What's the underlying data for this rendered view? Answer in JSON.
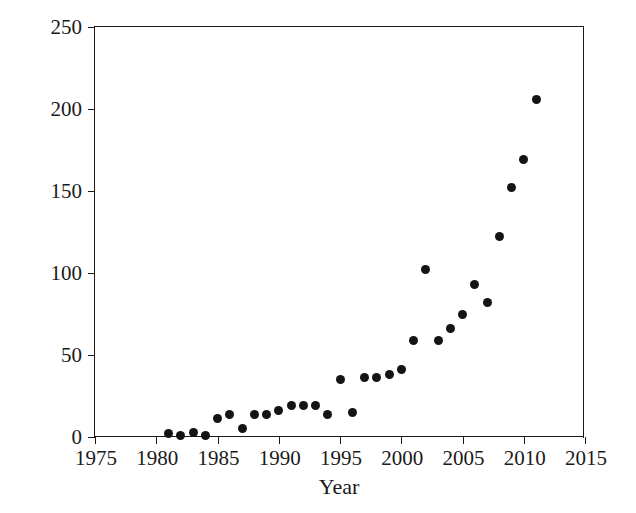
{
  "chart_data": {
    "type": "scatter",
    "title": "",
    "xlabel": "Year",
    "ylabel": "Number of Publications",
    "xlim": [
      1975,
      2015
    ],
    "ylim": [
      0,
      250
    ],
    "xticks": [
      1975,
      1980,
      1985,
      1990,
      1995,
      2000,
      2005,
      2010,
      2015
    ],
    "yticks": [
      0,
      50,
      100,
      150,
      200,
      250
    ],
    "grid": false,
    "legend": null,
    "marker": {
      "shape": "circle",
      "color": "#141414",
      "size": 9
    },
    "x": [
      1981,
      1982,
      1983,
      1984,
      1985,
      1986,
      1987,
      1988,
      1989,
      1990,
      1991,
      1992,
      1993,
      1994,
      1995,
      1996,
      1997,
      1998,
      1999,
      2000,
      2001,
      2002,
      2003,
      2004,
      2005,
      2006,
      2007,
      2008,
      2009,
      2010,
      2011
    ],
    "values": [
      2,
      1,
      3,
      1,
      11,
      14,
      5,
      14,
      14,
      16,
      19,
      19,
      19,
      14,
      35,
      15,
      36,
      36,
      38,
      41,
      59,
      102,
      59,
      66,
      75,
      93,
      82,
      122,
      152,
      169,
      206
    ],
    "points": [
      {
        "year": 1981,
        "value": 2
      },
      {
        "year": 1982,
        "value": 1
      },
      {
        "year": 1983,
        "value": 3
      },
      {
        "year": 1984,
        "value": 1
      },
      {
        "year": 1985,
        "value": 11
      },
      {
        "year": 1986,
        "value": 14
      },
      {
        "year": 1987,
        "value": 5
      },
      {
        "year": 1988,
        "value": 14
      },
      {
        "year": 1989,
        "value": 14
      },
      {
        "year": 1990,
        "value": 16
      },
      {
        "year": 1991,
        "value": 19
      },
      {
        "year": 1992,
        "value": 19
      },
      {
        "year": 1993,
        "value": 19
      },
      {
        "year": 1994,
        "value": 14
      },
      {
        "year": 1995,
        "value": 35
      },
      {
        "year": 1996,
        "value": 15
      },
      {
        "year": 1997,
        "value": 36
      },
      {
        "year": 1998,
        "value": 36
      },
      {
        "year": 1999,
        "value": 38
      },
      {
        "year": 2000,
        "value": 41
      },
      {
        "year": 2001,
        "value": 59
      },
      {
        "year": 2002,
        "value": 102
      },
      {
        "year": 2003,
        "value": 59
      },
      {
        "year": 2004,
        "value": 66
      },
      {
        "year": 2005,
        "value": 75
      },
      {
        "year": 2006,
        "value": 93
      },
      {
        "year": 2007,
        "value": 82
      },
      {
        "year": 2008,
        "value": 122
      },
      {
        "year": 2009,
        "value": 152
      },
      {
        "year": 2010,
        "value": 169
      },
      {
        "year": 2011,
        "value": 206
      }
    ]
  },
  "colors": {
    "background": "#ffffff",
    "axis": "#1a1a1a",
    "marker": "#141414",
    "text": "#1a1a1a"
  }
}
